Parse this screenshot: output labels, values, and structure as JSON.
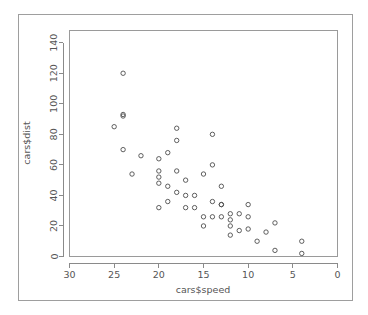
{
  "figure": {
    "background_color": "#ffffff",
    "border_color": "#9e9e9e",
    "panel_border_color": "#9a9a9a",
    "axis_color": "#8a8a8a",
    "text_color": "#555555",
    "point_color": "#4d4d4d"
  },
  "chart_data": {
    "type": "scatter",
    "title": "",
    "xlabel": "cars$speed",
    "ylabel": "cars$dist",
    "xlim": [
      30,
      0
    ],
    "ylim": [
      0,
      148
    ],
    "x_reversed": true,
    "grid": false,
    "legend": null,
    "xticks": [
      30,
      25,
      20,
      15,
      10,
      5,
      0
    ],
    "xticklabels": [
      "30",
      "25",
      "20",
      "15",
      "10",
      "5",
      "0"
    ],
    "yticks": [
      0,
      20,
      40,
      60,
      80,
      100,
      120,
      140
    ],
    "yticklabels": [
      "0",
      "20",
      "40",
      "60",
      "80",
      "100",
      "120",
      "140"
    ],
    "marker": "open-circle",
    "marker_radius": 2.2,
    "n_points": 50,
    "x": [
      4,
      4,
      7,
      7,
      8,
      9,
      10,
      10,
      10,
      11,
      11,
      12,
      12,
      12,
      12,
      13,
      13,
      13,
      13,
      14,
      14,
      14,
      14,
      15,
      15,
      15,
      16,
      16,
      17,
      17,
      17,
      18,
      18,
      18,
      18,
      19,
      19,
      19,
      20,
      20,
      20,
      20,
      20,
      22,
      23,
      24,
      24,
      24,
      24,
      25
    ],
    "y": [
      2,
      10,
      4,
      22,
      16,
      10,
      18,
      26,
      34,
      17,
      28,
      14,
      20,
      24,
      28,
      26,
      34,
      34,
      46,
      26,
      36,
      60,
      80,
      20,
      26,
      54,
      32,
      40,
      32,
      40,
      50,
      42,
      56,
      76,
      84,
      36,
      46,
      68,
      32,
      48,
      52,
      56,
      64,
      66,
      54,
      70,
      92,
      93,
      120,
      85
    ]
  }
}
